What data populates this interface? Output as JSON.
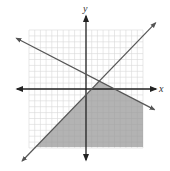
{
  "chart_data": {
    "type": "line",
    "title": "",
    "xlabel": "x",
    "ylabel": "y",
    "xlim": [
      -10,
      10
    ],
    "ylim": [
      -10,
      10
    ],
    "grid": true,
    "grid_step": 1,
    "series": [
      {
        "name": "boundary-1",
        "equation": "y = x - 1",
        "slope": 1,
        "intercept": -1,
        "style": "solid"
      },
      {
        "name": "boundary-2",
        "equation": "y = -0.5x + 2.5",
        "slope": -0.5,
        "intercept": 2.5,
        "style": "solid"
      }
    ],
    "shaded_region": {
      "description": "Region below both lines (y <= x - 1 and y <= -0.5x + 2.5)",
      "inequalities": [
        "y <= x - 1",
        "y <= -0.5x + 2.5"
      ],
      "intersection_point": [
        2.33,
        1.33
      ]
    },
    "legend": []
  },
  "labels": {
    "x_axis": "x",
    "y_axis": "y"
  },
  "colors": {
    "grid": "#d8d8d8",
    "axis": "#222222",
    "line": "#555555",
    "shade": "#9a9a9a"
  }
}
